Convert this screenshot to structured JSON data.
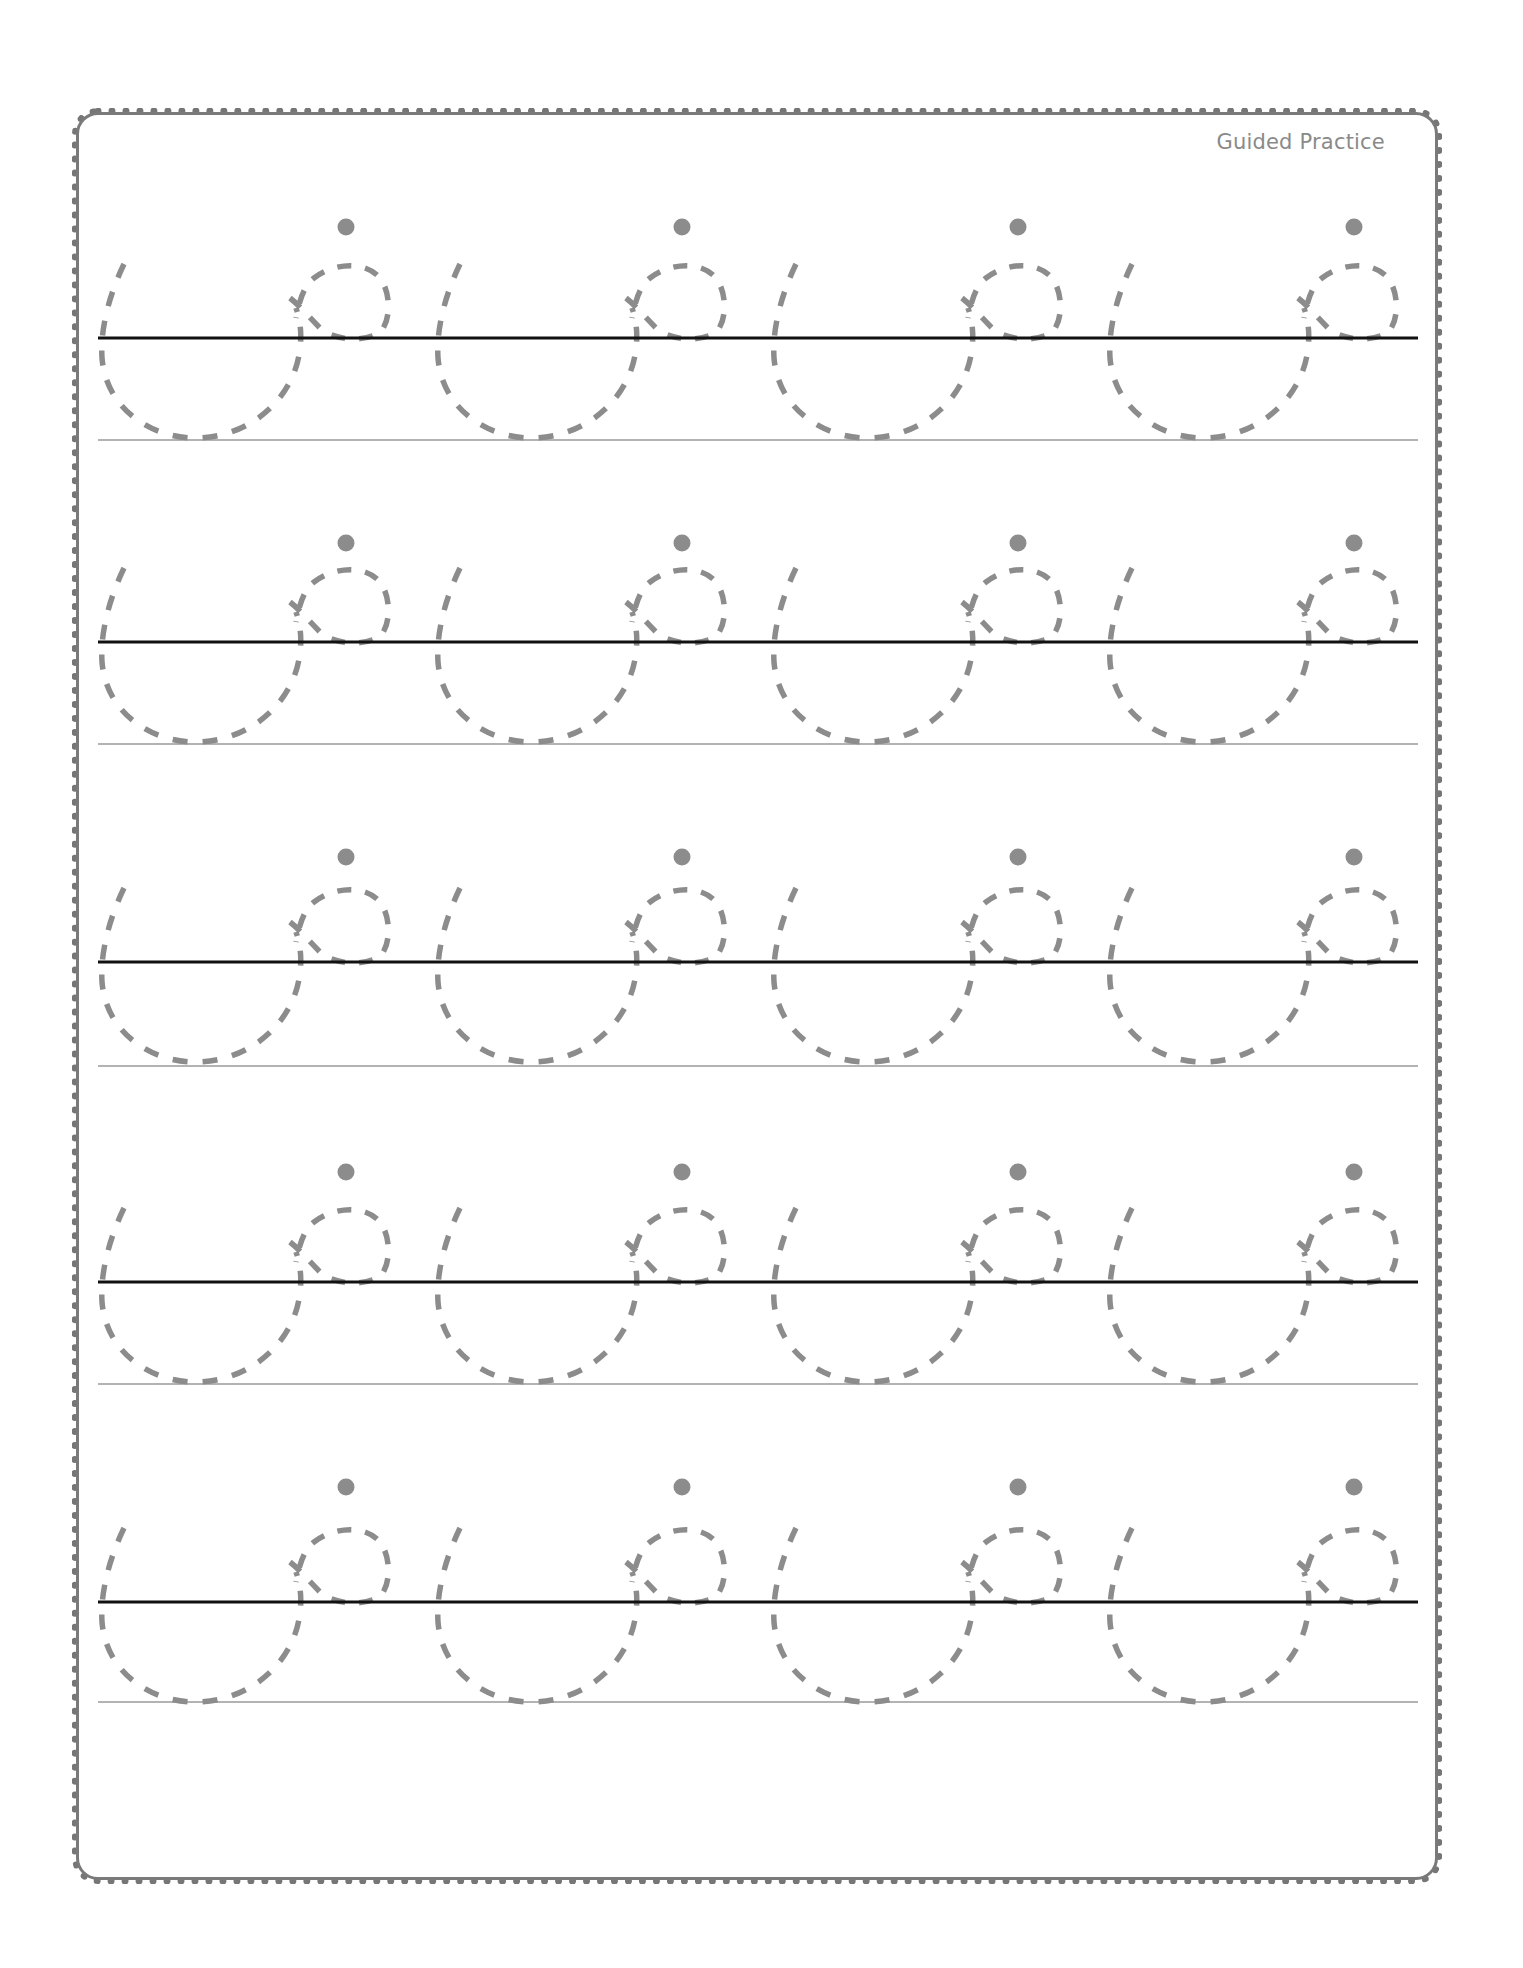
{
  "header": {
    "label": "Guided Practice"
  },
  "worksheet": {
    "type": "cursive letter tracing",
    "rows": 5,
    "letters_per_row": 4,
    "row_guides": [
      {
        "midline_y": 338,
        "baseline_y": 440,
        "dot_y": 227
      },
      {
        "midline_y": 642,
        "baseline_y": 744,
        "dot_y": 543
      },
      {
        "midline_y": 962,
        "baseline_y": 1066,
        "dot_y": 857
      },
      {
        "midline_y": 1282,
        "baseline_y": 1384,
        "dot_y": 1172
      },
      {
        "midline_y": 1602,
        "baseline_y": 1702,
        "dot_y": 1487
      }
    ],
    "letter_x_offsets": [
      100,
      436,
      772,
      1108
    ],
    "colors": {
      "border": "#767676",
      "trace": "#8c8c8c",
      "dot": "#8c8c8c",
      "midline": "#111111",
      "baseline": "#9a9a9a",
      "label": "#8a8a8a"
    }
  }
}
